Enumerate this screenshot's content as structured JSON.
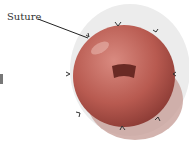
{
  "diagram": {
    "labels": [
      {
        "text": "Suture",
        "target": "suture-point"
      }
    ],
    "clipped_fragment": "d",
    "colors": {
      "tomato": "#b85a50",
      "shadow": "#c89a95",
      "bg_wash": "#e8e8e8"
    }
  }
}
